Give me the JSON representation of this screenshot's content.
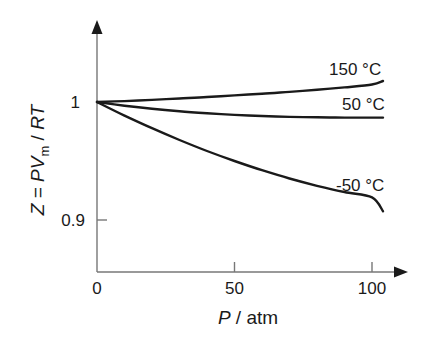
{
  "chart_data": {
    "type": "line",
    "title": "",
    "xlabel": "P / atm",
    "ylabel": "Z = PVm / RT",
    "xlim": [
      0,
      112
    ],
    "ylim": [
      0.875,
      1.065
    ],
    "grid": false,
    "legend_position": "inline labels at curve ends",
    "x_ticks": [
      0,
      50,
      100
    ],
    "x_tick_labels": [
      "0",
      "50",
      "100"
    ],
    "y_ticks": [
      0.9,
      1.0
    ],
    "y_tick_labels": [
      "0.9",
      "1"
    ],
    "x": [
      0,
      10,
      20,
      30,
      40,
      50,
      60,
      70,
      80,
      90,
      100,
      104
    ],
    "series": [
      {
        "name": "150 °C",
        "label": "150 °C",
        "values": [
          1.0,
          1.0008,
          1.0018,
          1.003,
          1.0042,
          1.0056,
          1.007,
          1.0086,
          1.0104,
          1.0124,
          1.0148,
          1.0178
        ]
      },
      {
        "name": "50 °C",
        "label": "50 °C",
        "values": [
          1.0,
          0.9968,
          0.9942,
          0.9921,
          0.9904,
          0.9891,
          0.9881,
          0.9874,
          0.987,
          0.9868,
          0.9868,
          0.9868
        ]
      },
      {
        "name": "-50 °C",
        "label": "-50 °C",
        "values": [
          1.0,
          0.9885,
          0.9778,
          0.9678,
          0.9585,
          0.95,
          0.9422,
          0.9352,
          0.929,
          0.9237,
          0.9192,
          0.9075
        ]
      }
    ]
  },
  "labels": {
    "y_tick_1": "1",
    "y_tick_09": "0.9",
    "x_tick_0": "0",
    "x_tick_50": "50",
    "x_tick_100": "100",
    "x_axis_italic": "P",
    "x_axis_rest": " / atm",
    "y_axis_z": "Z",
    "y_axis_eq": " = ",
    "y_axis_p": "PV",
    "y_axis_sub": "m",
    "y_axis_slash": " / ",
    "y_axis_rt": "RT",
    "series_150": "150 °C",
    "series_50": "50 °C",
    "series_m50": "-50 °C"
  }
}
